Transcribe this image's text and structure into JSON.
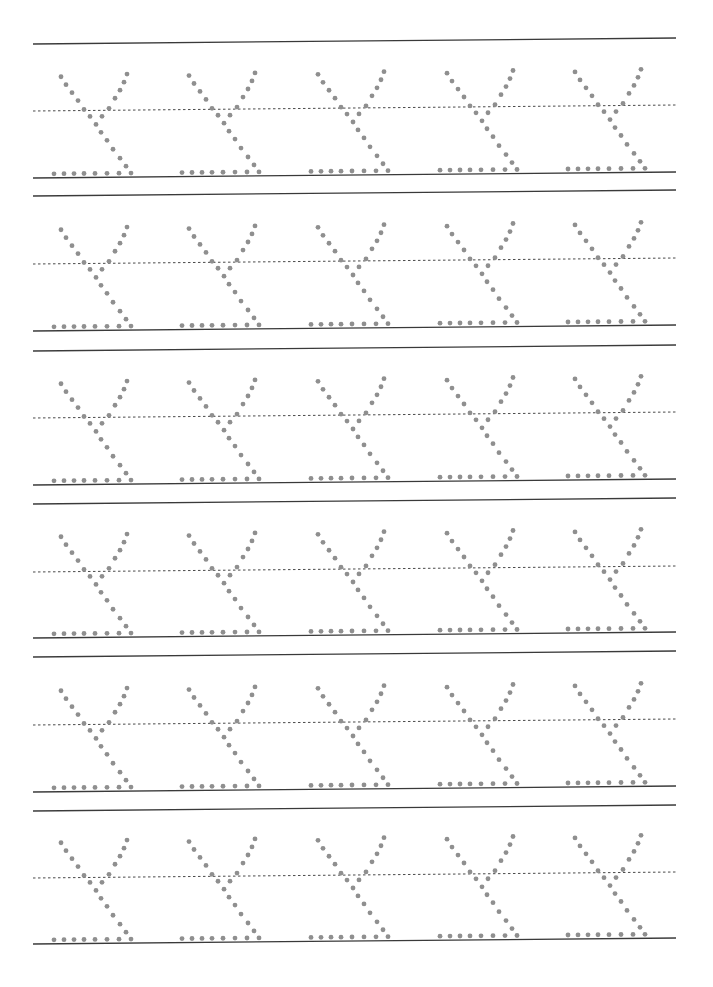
{
  "worksheet": {
    "type": "handwriting-tracing-practice",
    "letter": "Y",
    "rows_count": 6,
    "letters_per_row": 5,
    "colors": {
      "background": "#ffffff",
      "solid_line": "#3a3a3a",
      "dashed_line": "#4a4a4a",
      "dot": "#8f8f8f"
    },
    "line_x_start": 33,
    "line_x_end": 676,
    "tilt_px_over_width": -6,
    "dot_radius": 2.4,
    "rows": [
      {
        "top_line_y": 44,
        "midline_y": 111,
        "baseline_y": 178
      },
      {
        "top_line_y": 196,
        "midline_y": 264,
        "baseline_y": 331
      },
      {
        "top_line_y": 351,
        "midline_y": 418,
        "baseline_y": 485
      },
      {
        "top_line_y": 504,
        "midline_y": 572,
        "baseline_y": 638
      },
      {
        "top_line_y": 657,
        "midline_y": 725,
        "baseline_y": 792
      },
      {
        "top_line_y": 811,
        "midline_y": 878,
        "baseline_y": 944
      }
    ],
    "letter_x_offsets": [
      0,
      128,
      257,
      386,
      514
    ],
    "glyph_dots": [
      [
        61,
        -101
      ],
      [
        66,
        -93
      ],
      [
        72,
        -85
      ],
      [
        78,
        -77
      ],
      [
        84,
        -68
      ],
      [
        127,
        -103
      ],
      [
        124,
        -95
      ],
      [
        120,
        -87
      ],
      [
        115,
        -79
      ],
      [
        109,
        -69
      ],
      [
        90,
        -61
      ],
      [
        102,
        -61
      ],
      [
        96,
        -53
      ],
      [
        101,
        -45
      ],
      [
        107,
        -37
      ],
      [
        113,
        -28
      ],
      [
        120,
        -19
      ],
      [
        126,
        -11
      ],
      [
        54,
        -4
      ],
      [
        64,
        -4
      ],
      [
        74,
        -4
      ],
      [
        84,
        -4
      ],
      [
        95,
        -4
      ],
      [
        107,
        -4
      ],
      [
        119,
        -4
      ],
      [
        131,
        -4
      ]
    ]
  }
}
